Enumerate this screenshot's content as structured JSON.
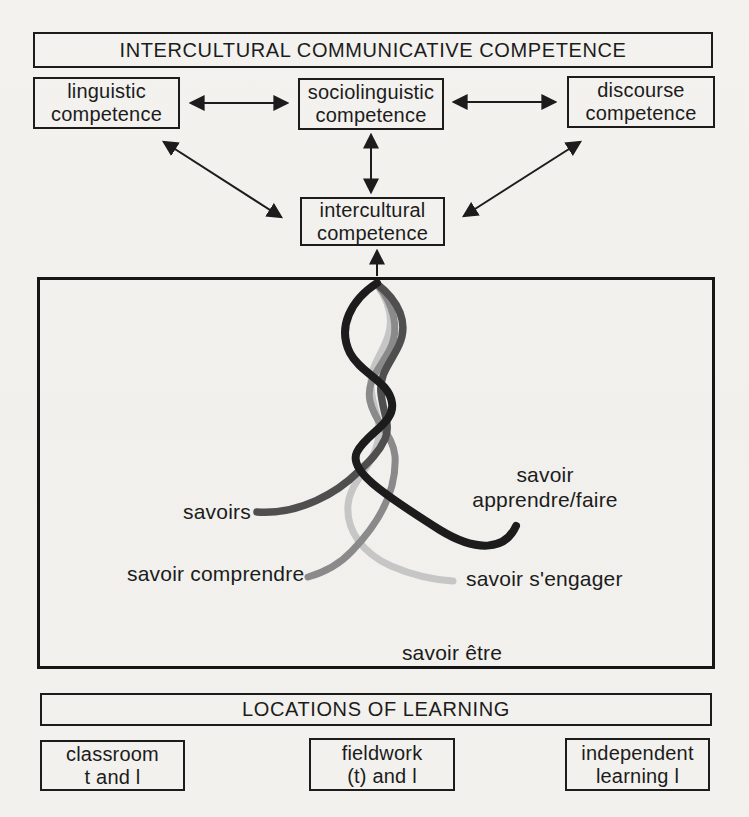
{
  "diagram": {
    "title": "INTERCULTURAL COMMUNICATIVE COMPETENCE",
    "competences": {
      "linguistic": {
        "line1": "linguistic",
        "line2": "competence"
      },
      "sociolinguistic": {
        "line1": "sociolinguistic",
        "line2": "competence"
      },
      "discourse": {
        "line1": "discourse",
        "line2": "competence"
      },
      "intercultural": {
        "line1": "intercultural",
        "line2": "competence"
      }
    },
    "savoir_labels": {
      "savoirs": "savoirs",
      "apprendre_line1": "savoir",
      "apprendre_line2": "apprendre/faire",
      "comprendre": "savoir comprendre",
      "sengager": "savoir s'engager",
      "etre": "savoir être"
    },
    "strand_colors": {
      "savoirs": "#4f4f4f",
      "apprendre_faire": "#1c1c1c",
      "comprendre": "#8a8a8a",
      "sengager": "#c6c6c6"
    },
    "ink_color": "#1c1c1c",
    "locations": {
      "title": "LOCATIONS OF LEARNING",
      "classroom": {
        "line1": "classroom",
        "line2": "t and l"
      },
      "fieldwork": {
        "line1": "fieldwork",
        "line2": "(t) and l"
      },
      "independent": {
        "line1": "independent",
        "line2": "learning l"
      }
    }
  }
}
